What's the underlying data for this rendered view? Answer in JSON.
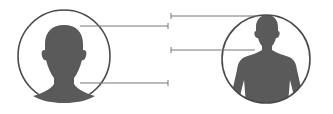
{
  "diagram": {
    "colors": {
      "silhouette": "#5a5a5a",
      "circle_stroke": "#4a4a4a",
      "leader_line": "#777777",
      "background": "#ffffff"
    },
    "figures": [
      {
        "id": "head-portrait",
        "kind": "head-and-neck silhouette",
        "cx": 64,
        "cy": 56,
        "r": 47
      },
      {
        "id": "upper-body-portrait",
        "kind": "head-and-torso silhouette",
        "cx": 266,
        "cy": 59,
        "r": 45
      }
    ],
    "leader_lines": [
      {
        "from": "head-portrait",
        "y": 26,
        "x1": 80,
        "x2": 168
      },
      {
        "from": "head-portrait",
        "y": 83,
        "x1": 80,
        "x2": 168
      },
      {
        "from": "upper-body-portrait",
        "y": 16,
        "x1": 171,
        "x2": 258
      },
      {
        "from": "upper-body-portrait",
        "y": 50,
        "x1": 171,
        "x2": 255
      }
    ],
    "labels": []
  }
}
